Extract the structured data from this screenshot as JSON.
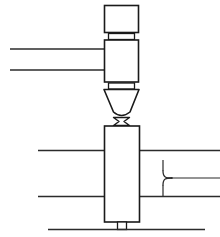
{
  "figure": {
    "background_color": "#ffffff",
    "line_color": "#1a1a1a",
    "thin_line_color": "#2b2b2b",
    "width": 220,
    "height": 237
  },
  "parts": {
    "torch_top_body": {
      "name": "torch-upper-housing",
      "x": 104.5,
      "y": 5.5,
      "width": 34,
      "height": 27
    },
    "torch_collar_upper": {
      "name": "torch-upper-collar",
      "x": 108.5,
      "y": 33.5,
      "width": 26,
      "height": 6
    },
    "torch_mid_body": {
      "name": "torch-mid-housing",
      "x": 104.5,
      "y": 40,
      "width": 34,
      "height": 42
    },
    "torch_collar_lower": {
      "name": "torch-lower-collar",
      "x": 108.5,
      "y": 83,
      "width": 26,
      "height": 6
    },
    "nozzle_cone": {
      "name": "torch-nozzle-cone",
      "top_left_x": 104,
      "top_right_x": 139,
      "top_y": 89.5,
      "tip_left_x": 113.5,
      "tip_right_x": 130,
      "tip_y": 114.5
    },
    "weld_bead": {
      "name": "weld-bead",
      "center_x": 121.5,
      "top_y": 117.5,
      "bottom_y": 125.5,
      "top_half_width": 8,
      "waist_half_width": 2.5
    },
    "workpiece_block": {
      "name": "workpiece-vertical-block",
      "x": 104.5,
      "y": 126,
      "width": 35,
      "height": 96
    },
    "base_stem": {
      "name": "workpiece-base-stem",
      "x": 117.5,
      "y": 222,
      "width": 9,
      "height": 7
    }
  },
  "lines": {
    "upper_left_lead_1": {
      "name": "upper-left-lead-line-1",
      "x1": 10,
      "y1": 49,
      "x2": 104.5,
      "y2": 49
    },
    "upper_left_lead_2": {
      "name": "upper-left-lead-line-2",
      "x1": 10,
      "y1": 70,
      "x2": 104.5,
      "y2": 70
    },
    "mid_left_line_1": {
      "name": "workpiece-left-edge-line-1",
      "x1": 38,
      "y1": 150.5,
      "x2": 104.5,
      "y2": 150.5
    },
    "mid_right_line_1": {
      "name": "workpiece-right-edge-line-1",
      "x1": 139.5,
      "y1": 150.5,
      "x2": 220,
      "y2": 150.5
    },
    "mid_left_line_2": {
      "name": "workpiece-left-edge-line-2",
      "x1": 38,
      "y1": 196.5,
      "x2": 104.5,
      "y2": 196.5
    },
    "mid_right_line_2": {
      "name": "workpiece-right-edge-line-2",
      "x1": 139.5,
      "y1": 196.5,
      "x2": 220,
      "y2": 196.5
    },
    "branch_vertical_upper": {
      "name": "branch-vertical-upper",
      "x1": 163,
      "y1": 160,
      "x2": 163,
      "y2": 171
    },
    "branch_vertical_lower": {
      "name": "branch-vertical-lower",
      "x1": 163,
      "y1": 185,
      "x2": 163,
      "y2": 196
    },
    "branch_horizontal": {
      "name": "branch-horizontal",
      "x1": 172,
      "y1": 178,
      "x2": 220,
      "y2": 178
    },
    "baseline": {
      "name": "base-plate-line",
      "x1": 48,
      "y1": 229.5,
      "x2": 205,
      "y2": 229.5
    }
  },
  "curves": {
    "branch_fillet_upper": {
      "name": "branch-fillet-upper-curve",
      "path": "M 163 171 C 163 177.5 166 178 172 178"
    },
    "branch_fillet_lower": {
      "name": "branch-fillet-lower-curve",
      "path": "M 172 178 C 166 178 163 178.5 163 185"
    }
  }
}
